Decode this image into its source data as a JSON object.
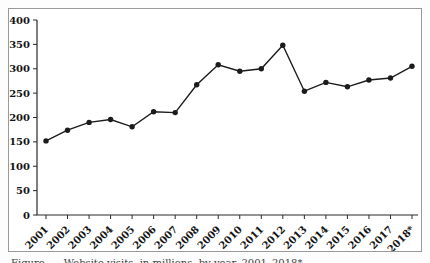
{
  "figure": {
    "caption": "Figure      Website visits, in millions, by year, 2001–2018*"
  },
  "chart_data": {
    "type": "line",
    "title": "",
    "xlabel": "",
    "ylabel": "",
    "categories": [
      "2001",
      "2002",
      "2003",
      "2004",
      "2005",
      "2006",
      "2007",
      "2008",
      "2009",
      "2010",
      "2011",
      "2012",
      "2013",
      "2014",
      "2015",
      "2016",
      "2017",
      "2018*"
    ],
    "series": [
      {
        "name": "annual-values",
        "values": [
          152,
          174,
          190,
          196,
          181,
          212,
          210,
          267,
          308,
          295,
          300,
          348,
          254,
          272,
          263,
          277,
          281,
          305
        ]
      }
    ],
    "ylim": [
      0,
      400
    ],
    "ytick_step": 50,
    "yticks": [
      0,
      50,
      100,
      150,
      200,
      250,
      300,
      350,
      400
    ],
    "grid": false,
    "legend": "none",
    "marker": "circle",
    "x_label_rotation": -45,
    "colors": {
      "line": "#1b1b1b",
      "marker": "#1b1b1b",
      "axis": "#2a2a2a",
      "tick_label": "#141414",
      "frame_border": "#9a9a9a",
      "background": "#ffffff"
    }
  }
}
